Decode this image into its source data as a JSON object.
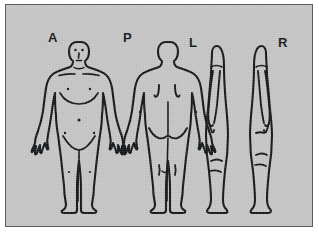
{
  "diagram": {
    "background_color": "#c6c6c6",
    "page_color": "#ffffff",
    "ink_color": "#15181a",
    "border_color": "#5a5a5a"
  },
  "views": [
    {
      "id": "anterior",
      "label": "A",
      "name": "anterior-view",
      "meaning": "Anterior (front)",
      "orientation": "front",
      "features": [
        "eyes",
        "nose",
        "mouth",
        "clavicles",
        "nipples",
        "ribcage",
        "navel",
        "groin",
        "hands",
        "feet"
      ]
    },
    {
      "id": "posterior",
      "label": "P",
      "name": "posterior-view",
      "meaning": "Posterior (back)",
      "orientation": "back",
      "features": [
        "scapulae",
        "spine",
        "gluteal-fold",
        "popliteal-marks",
        "hands",
        "feet"
      ]
    },
    {
      "id": "left-lateral",
      "label": "L",
      "name": "left-lateral-view",
      "meaning": "Left lateral side",
      "orientation": "side-facing-left",
      "features": [
        "arm-at-side",
        "knee-mark",
        "calf",
        "foot"
      ]
    },
    {
      "id": "right-lateral",
      "label": "R",
      "name": "right-lateral-view",
      "meaning": "Right lateral side",
      "orientation": "side-facing-right",
      "features": [
        "arm-at-side",
        "knee-mark",
        "calf",
        "foot"
      ]
    }
  ],
  "labels": {
    "anterior": "A",
    "posterior": "P",
    "left": "L",
    "right": "R"
  }
}
